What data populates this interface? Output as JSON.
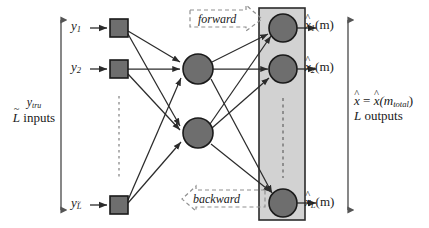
{
  "diagram": {
    "colors": {
      "node_fill": "#6e6e6e",
      "node_stroke": "#1a1a1a",
      "square_fill": "#6e6e6e",
      "output_box_fill": "#d2d2d2",
      "output_box_stroke": "#2b2b2b",
      "edge": "#2b2b2b",
      "dashed": "#777777",
      "text": "#1a1a1a",
      "background": "#ffffff"
    },
    "input_layer": {
      "name": "input-layer",
      "shape": "square",
      "nodes": [
        {
          "id": "y1",
          "label_base": "y",
          "label_sub": "1",
          "cx": 119,
          "cy": 28
        },
        {
          "id": "y2",
          "label_base": "y",
          "label_sub": "2",
          "cx": 119,
          "cy": 69
        },
        {
          "id": "yL",
          "label_base": "y",
          "label_sub": "L",
          "sub_tilde": true,
          "cx": 119,
          "cy": 205
        }
      ],
      "ellipsis": {
        "x": 119,
        "y_start": 96,
        "y_end": 180
      }
    },
    "hidden_layer": {
      "name": "hidden-layer",
      "shape": "circle",
      "nodes": [
        {
          "id": "h1",
          "cx": 198,
          "cy": 69,
          "r": 15
        },
        {
          "id": "h2",
          "cx": 198,
          "cy": 133,
          "r": 15
        }
      ]
    },
    "output_layer": {
      "name": "output-layer",
      "shape": "circle",
      "box": {
        "x": 259,
        "y": 8,
        "width": 46,
        "height": 212
      },
      "nodes": [
        {
          "id": "x1",
          "cx": 283,
          "cy": 28,
          "r": 14
        },
        {
          "id": "x2",
          "cx": 283,
          "cy": 69,
          "r": 14
        },
        {
          "id": "xL",
          "cx": 283,
          "cy": 203,
          "r": 14
        }
      ],
      "ellipsis": {
        "x": 283,
        "y_start": 98,
        "y_end": 178
      }
    },
    "edges": [
      {
        "from": "y1",
        "to": "h1"
      },
      {
        "from": "y1",
        "to": "h2"
      },
      {
        "from": "y2",
        "to": "h1"
      },
      {
        "from": "y2",
        "to": "h2"
      },
      {
        "from": "yL",
        "to": "h1"
      },
      {
        "from": "yL",
        "to": "h2"
      },
      {
        "from": "h1",
        "to": "x1"
      },
      {
        "from": "h1",
        "to": "x2"
      },
      {
        "from": "h1",
        "to": "xL"
      },
      {
        "from": "h2",
        "to": "x1"
      },
      {
        "from": "h2",
        "to": "x2"
      },
      {
        "from": "h2",
        "to": "xL"
      }
    ],
    "input_arrows": [
      {
        "id": "arrow-into-y1",
        "x1": 90,
        "y1": 28,
        "x2": 109,
        "y2": 28
      },
      {
        "id": "arrow-into-y2",
        "x1": 90,
        "y1": 69,
        "x2": 109,
        "y2": 69
      },
      {
        "id": "arrow-into-yL",
        "x1": 90,
        "y1": 205,
        "x2": 109,
        "y2": 205
      }
    ],
    "output_arrows": [
      {
        "id": "arrow-out-x1",
        "x1": 297,
        "y1": 28,
        "x2": 318,
        "y2": 28
      },
      {
        "id": "arrow-out-x2",
        "x1": 297,
        "y1": 69,
        "x2": 318,
        "y2": 69
      },
      {
        "id": "arrow-out-xL",
        "x1": 297,
        "y1": 203,
        "x2": 318,
        "y2": 203
      }
    ],
    "labels": {
      "y1": "y",
      "y1_sub": "1",
      "y2": "y",
      "y2_sub": "2",
      "yL": "y",
      "yL_sub": "L",
      "x1": "x",
      "x1_sub": "1",
      "x1_arg": "(m)",
      "x2": "x",
      "x2_sub": "2",
      "x2_arg": "(m)",
      "xL": "x",
      "xL_sub": "L",
      "xL_arg": "(m)",
      "hat": "^",
      "tilde": "~"
    },
    "side_labels": {
      "left": {
        "name": "input-count-label",
        "line1_base": "y",
        "line1_sub": "tru",
        "line2_var": "L",
        "line2_text": " inputs"
      },
      "right": {
        "name": "output-count-label",
        "line1_lhs": "x",
        "line1_eq": " = ",
        "line1_rhs": "x",
        "line1_arg_open": "(m",
        "line1_arg_sub": "total",
        "line1_arg_close": ")",
        "line2_var": "L",
        "line2_text": " outputs"
      }
    },
    "measure_arrows": [
      {
        "id": "left-extent-arrow",
        "x": 61,
        "y_top": 18,
        "y_bottom": 212
      },
      {
        "id": "right-extent-arrow",
        "x": 348,
        "y_top": 18,
        "y_bottom": 212
      }
    ],
    "callouts": [
      {
        "id": "forward",
        "label": "forward",
        "direction": "right",
        "x": 188,
        "y": 6,
        "width": 76,
        "height": 26
      },
      {
        "id": "backward",
        "label": "backward",
        "direction": "left",
        "x": 183,
        "y": 186,
        "width": 84,
        "height": 26
      }
    ]
  }
}
